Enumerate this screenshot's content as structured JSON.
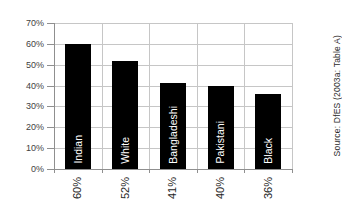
{
  "chart_data": {
    "type": "bar",
    "title": "",
    "categories": [
      "Indian",
      "White",
      "Bangladeshi",
      "Pakistani",
      "Black"
    ],
    "values": [
      60,
      52,
      41,
      40,
      36
    ],
    "value_labels": [
      "60%",
      "52%",
      "41%",
      "40%",
      "36%"
    ],
    "y_tick_labels": [
      "70%",
      "60%",
      "50%",
      "40%",
      "30%",
      "20%",
      "10%",
      "0%"
    ],
    "ylim": [
      0,
      70
    ],
    "xlabel": "",
    "ylabel": "",
    "grid": "horizontal and vertical major gridlines",
    "legend": "none",
    "bar_color": "#000000",
    "category_label_color": "#ffffff",
    "gridline_color": "#c6c6c6",
    "axis_color": "#8f8f8f",
    "source_note": "Source: DfES (2003a: Table A)"
  }
}
